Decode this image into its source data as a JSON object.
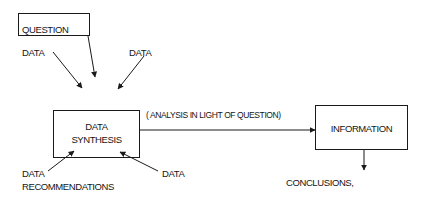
{
  "diagram": {
    "nodes": {
      "question": {
        "label": "QUESTION"
      },
      "synthesis": {
        "line1": "DATA",
        "line2": "SYNTHESIS"
      },
      "information": {
        "label": "INFORMATION"
      }
    },
    "inputs": {
      "data_top_left": "DATA",
      "data_top_right": "DATA",
      "data_bottom_left": "DATA",
      "recommendations": "RECOMMENDATIONS",
      "data_bottom_right": "DATA"
    },
    "edges": {
      "analysis_label": "( ANALYSIS IN LIGHT OF QUESTION)"
    },
    "outputs": {
      "conclusions": "CONCLUSIONS,"
    },
    "colors": {
      "line": "#1a1a1a",
      "background": "#ffffff"
    }
  }
}
